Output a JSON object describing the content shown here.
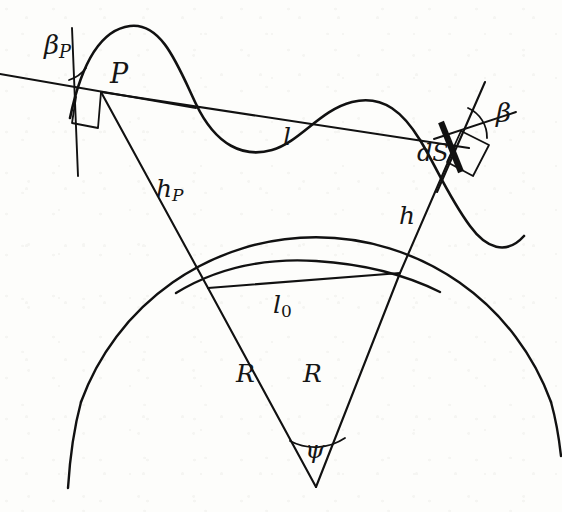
{
  "figure": {
    "kind": "geometry-diagram",
    "background_color": "#fdfdfb",
    "ink_color": "#111111"
  },
  "labels": {
    "point_p": "P",
    "beta_p_main": "β",
    "beta_p_sub": "P",
    "beta": "β",
    "chord_l": "l",
    "surface_element": "dS",
    "height_p_main": "h",
    "height_p_sub": "P",
    "height_h": "h",
    "chord_l0_main": "l",
    "chord_l0_sub": "0",
    "radius_left": "R",
    "radius_right": "R",
    "angle_psi": "ψ"
  },
  "geometry": {
    "point_P": [
      101,
      92
    ],
    "point_dS": [
      455,
      146
    ],
    "junction_left": [
      208,
      288
    ],
    "junction_right": [
      400,
      273
    ],
    "apex": [
      316,
      487
    ],
    "wavy_curve_path": "M 70,118 C 80,70 98,30 130,26 C 162,22 178,66 196,104 C 216,146 244,158 272,150 C 300,142 320,110 352,102 C 384,94 404,114 420,140 C 436,166 448,196 470,226 C 486,248 506,256 524,236",
    "right_curve_path": "M 416,86 C 430,118 444,142 458,168 C 474,198 492,220 516,236",
    "big_circle": {
      "cx": 316,
      "cy": 487,
      "r": 250,
      "start_angle_deg": 200,
      "end_angle_deg": 340
    },
    "small_circle": {
      "cx": 316,
      "cy": 487,
      "r": 218
    },
    "tangent_at_P": {
      "from": [
        0,
        74
      ],
      "to": [
        196,
        108
      ]
    },
    "normal_at_P": {
      "from": [
        72,
        28
      ],
      "to": [
        78,
        176
      ]
    },
    "tangent_at_dS": {
      "from": [
        428,
        84
      ],
      "to": [
        512,
        113
      ]
    },
    "normal_at_dS": {
      "from": [
        485,
        82
      ],
      "to": [
        420,
        232
      ]
    },
    "chord_l": {
      "from": [
        101,
        92
      ],
      "to": [
        469,
        148
      ]
    },
    "chord_l0": {
      "from": [
        208,
        288
      ],
      "to": [
        400,
        273
      ]
    },
    "segment_hP": {
      "from": [
        101,
        92
      ],
      "to": [
        208,
        288
      ]
    },
    "segment_h": {
      "from": [
        455,
        146
      ],
      "to": [
        400,
        273
      ]
    },
    "radius_left_seg": {
      "from": [
        208,
        288
      ],
      "to": [
        316,
        487
      ]
    },
    "radius_right_seg": {
      "from": [
        400,
        273
      ],
      "to": [
        316,
        487
      ]
    },
    "right_angle_marker_P": true,
    "right_angle_marker_dS": true,
    "angle_arc_beta_P": true,
    "angle_arc_beta": true,
    "angle_arc_psi": true
  }
}
